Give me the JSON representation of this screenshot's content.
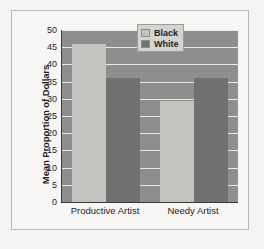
{
  "chart_data": {
    "type": "bar",
    "title": "",
    "subtitle": "",
    "xlabel": "",
    "ylabel": "Mean Proportion of Dollars",
    "categories": [
      "Productive Artist",
      "Needy Artist"
    ],
    "series": [
      {
        "name": "Black",
        "values": [
          46,
          29.5
        ],
        "color": "#c3c4c0"
      },
      {
        "name": "White",
        "values": [
          36,
          36
        ],
        "color": "#6f7070"
      }
    ],
    "ylim": [
      0,
      50
    ],
    "ytick_labels": [
      "0",
      "5",
      "10",
      "15",
      "20",
      "25",
      "30",
      "35",
      "40",
      "45",
      "50"
    ],
    "ytick_values": [
      0,
      5,
      10,
      15,
      20,
      25,
      30,
      35,
      40,
      45,
      50
    ],
    "grid": true,
    "grid_color": "#e8e8e6",
    "legend_position": "top-right",
    "plot_background": "#8e8e8e",
    "figure_background": "#f5f4f2",
    "axis_color": "#3a3a3a"
  }
}
